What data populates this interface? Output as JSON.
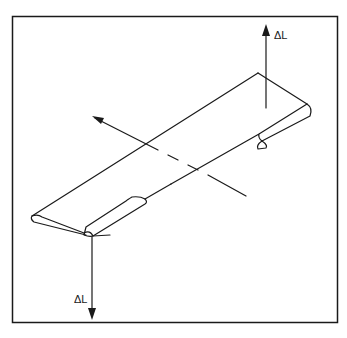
{
  "diagram": {
    "labels": {
      "lift_up": "ΔL",
      "lift_down": "ΔL"
    },
    "colors": {
      "ink": "#1a1a1a",
      "background": "#ffffff"
    }
  }
}
